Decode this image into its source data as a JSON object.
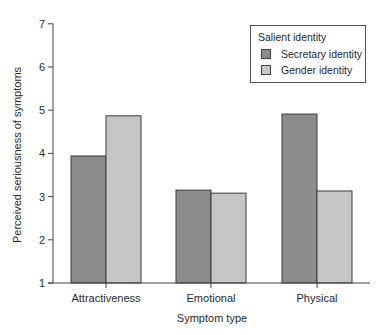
{
  "chart_data": {
    "type": "bar",
    "title": "",
    "xlabel": "Symptom type",
    "ylabel": "Perceived seriousness of symptoms",
    "ylim": [
      1,
      7
    ],
    "yticks": [
      1,
      2,
      3,
      4,
      5,
      6,
      7
    ],
    "categories": [
      "Attractiveness",
      "Emotional",
      "Physical"
    ],
    "series": [
      {
        "name": "Secretary identity",
        "color": "#8c8c8c",
        "values": [
          3.94,
          3.15,
          4.91
        ]
      },
      {
        "name": "Gender identity",
        "color": "#c6c6c6",
        "values": [
          4.87,
          3.08,
          3.13
        ]
      }
    ],
    "grid": false,
    "legend": {
      "title": "Salient identity",
      "position": "upper right"
    }
  },
  "legend": {
    "title": "Salient identity",
    "items": [
      {
        "label": "Secretary identity",
        "color": "#8c8c8c"
      },
      {
        "label": "Gender identity",
        "color": "#c6c6c6"
      }
    ]
  }
}
